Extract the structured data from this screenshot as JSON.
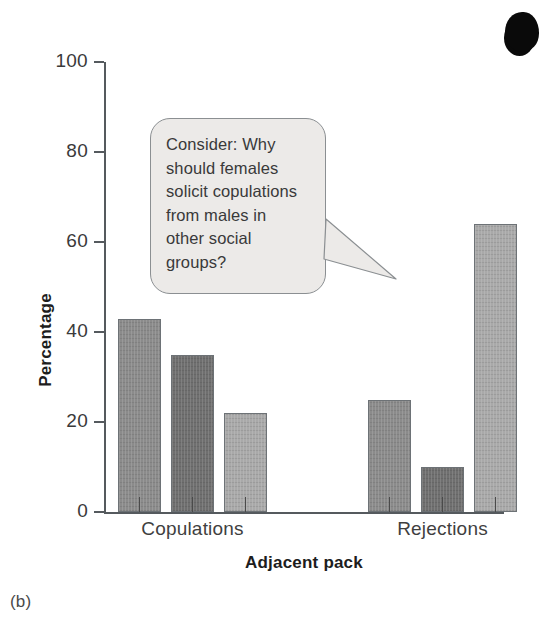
{
  "figure": {
    "caption": "(b)",
    "artifact": "scan-artifact-blob"
  },
  "annotation": {
    "text": "Consider: Why should females solicit copulations from males in other social groups?",
    "lines": [
      "Consider: Why",
      "should females",
      "solicit copulations",
      "from males in",
      "other social",
      "groups?"
    ],
    "shape": "rounded-rectangle-speech-bubble",
    "fill": "#eceae8",
    "stroke": "#8b8f92"
  },
  "chart_data": {
    "type": "bar",
    "title": "",
    "xlabel": "Adjacent pack",
    "ylabel": "Percentage",
    "categories": [
      "Copulations",
      "Rejections"
    ],
    "ylim": [
      0,
      100
    ],
    "yticks": [
      0,
      20,
      40,
      60,
      80,
      100
    ],
    "ytick_labels": [
      "0",
      "20",
      "40",
      "60",
      "80",
      "100"
    ],
    "grid": false,
    "legend": "none",
    "series": [
      {
        "name": "series-1",
        "color": "#8b8b8b",
        "values": [
          43,
          25
        ]
      },
      {
        "name": "series-2",
        "color": "#6f6f6f",
        "values": [
          35,
          10
        ]
      },
      {
        "name": "series-3",
        "color": "#a9a9a9",
        "values": [
          22,
          64
        ]
      }
    ],
    "bars": [
      {
        "group": "Copulations",
        "series": "series-1",
        "value": 43,
        "color": "#8b8b8b"
      },
      {
        "group": "Copulations",
        "series": "series-2",
        "value": 35,
        "color": "#6f6f6f"
      },
      {
        "group": "Copulations",
        "series": "series-3",
        "value": 22,
        "color": "#a9a9a9"
      },
      {
        "group": "Rejections",
        "series": "series-1",
        "value": 25,
        "color": "#8b8b8b"
      },
      {
        "group": "Rejections",
        "series": "series-2",
        "value": 10,
        "color": "#6f6f6f"
      },
      {
        "group": "Rejections",
        "series": "series-3",
        "value": 64,
        "color": "#a9a9a9"
      }
    ]
  }
}
